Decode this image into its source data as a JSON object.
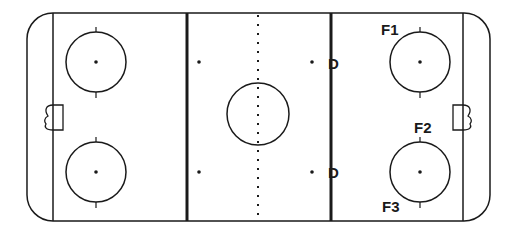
{
  "diagram": {
    "type": "hockey-rink",
    "colors": {
      "line": "#1a1a1a",
      "background": "#ffffff"
    },
    "labels": [
      {
        "id": "f1",
        "text": "F1",
        "x": 381,
        "y": 35
      },
      {
        "id": "d-top",
        "text": "D",
        "x": 328,
        "y": 69
      },
      {
        "id": "f2",
        "text": "F2",
        "x": 414,
        "y": 133
      },
      {
        "id": "d-bottom",
        "text": "D",
        "x": 328,
        "y": 178
      },
      {
        "id": "f3",
        "text": "F3",
        "x": 382,
        "y": 212
      }
    ]
  }
}
